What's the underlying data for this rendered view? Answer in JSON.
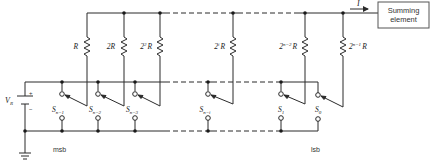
{
  "diagram": {
    "source_label": "V",
    "source_subscript": "R",
    "plus_sign": "+",
    "minus_sign": "−",
    "current_label": "I",
    "summing_element": {
      "line1": "Summing",
      "line2": "element"
    },
    "msb_label": "msb",
    "lsb_label": "lsb",
    "resistors": [
      {
        "base": "R",
        "exp": "",
        "x": 87
      },
      {
        "base": "2R",
        "exp": "",
        "x": 124
      },
      {
        "base": "2",
        "exp": "2",
        "suffix": "R",
        "x": 160
      },
      {
        "base": "2",
        "exp": "i",
        "suffix": "R",
        "x": 233
      },
      {
        "base": "2",
        "exp": "n−2",
        "suffix": "R",
        "x": 305
      },
      {
        "base": "2",
        "exp": "n−1",
        "suffix": "R",
        "x": 343
      }
    ],
    "switches": [
      {
        "name": "S",
        "sub": "n−1",
        "x": 62
      },
      {
        "name": "S",
        "sub": "n−2",
        "x": 98
      },
      {
        "name": "S",
        "sub": "n−3",
        "x": 135
      },
      {
        "name": "S",
        "sub": "n−i",
        "x": 208
      },
      {
        "name": "S",
        "sub": "1",
        "x": 281
      },
      {
        "name": "S",
        "sub": "0",
        "x": 318
      }
    ],
    "colors": {
      "line": "#2a2a2a",
      "box_border": "#555555",
      "background": "#ffffff"
    }
  }
}
